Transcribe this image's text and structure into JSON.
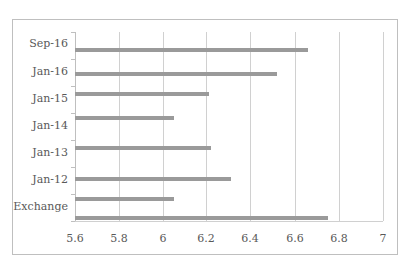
{
  "chart_data": {
    "type": "bar",
    "orientation": "horizontal",
    "title": "",
    "xlabel": "",
    "ylabel": "",
    "xlim": [
      5.6,
      7
    ],
    "grid": true,
    "legend": null,
    "x_ticks": [
      "5.6",
      "5.8",
      "6",
      "6.2",
      "6.4",
      "6.6",
      "6.8",
      "7"
    ],
    "category_labels_visible": [
      "Sep-16",
      "Jan-16",
      "Jan-15",
      "Jan-14",
      "Jan-13",
      "Jan-12",
      "Exchange"
    ],
    "categories": [
      "Sep-16",
      "Jan-16",
      "Jan-15",
      "Jan-14",
      "Jan-13",
      "Jan-12",
      "",
      "Exchange"
    ],
    "values": [
      6.66,
      6.52,
      6.21,
      6.05,
      6.22,
      6.31,
      6.05,
      6.75
    ]
  },
  "layout": {
    "x_ticks_px": [
      75,
      119,
      163,
      206,
      250,
      295,
      339,
      383
    ],
    "bar_tops_px": [
      48,
      72,
      92,
      116,
      146,
      177,
      197,
      216
    ],
    "label_tops_px": [
      37,
      65,
      92,
      119,
      146,
      173,
      200
    ],
    "ytick_tops_px": [
      32,
      59,
      86,
      113,
      140,
      167,
      194,
      221
    ],
    "px_per_unit": 220,
    "x_origin_px": 75,
    "x_origin_value": 5.6
  }
}
